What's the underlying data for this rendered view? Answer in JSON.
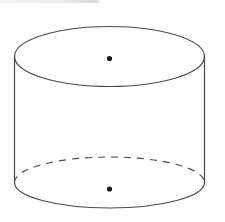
{
  "page": {
    "title": "Cylinder diagram",
    "width": 225,
    "height": 222,
    "background_color": "#ffffff",
    "alt_text": "Line drawing of a right circular cylinder shown in oblique view, with the hidden back half of the base circle drawn as a dashed arc and a dot marking the center of the top face and the center of the base."
  },
  "figure": {
    "name": "cylinder",
    "shape_type": "right-circular-cylinder",
    "stroke_color": "#4a4a50",
    "fill_color": "none",
    "stroke_width": 1.1,
    "top_face": {
      "label": "top circular face",
      "center_x": 109.5,
      "center_y": 56.5,
      "radius_x": 95,
      "radius_y": 30,
      "stroke_style": "solid"
    },
    "bottom_face": {
      "label": "bottom circular face",
      "center_x": 109.5,
      "center_y": 182.5,
      "radius_x": 95,
      "radius_y": 25.5,
      "front_stroke_style": "solid",
      "back_stroke_style": "dashed",
      "dash_pattern": "7 6"
    },
    "left_side_edge": {
      "label": "left lateral edge",
      "x": 14.5,
      "y_top": 56.5,
      "y_bottom": 182.5
    },
    "right_side_edge": {
      "label": "right lateral edge",
      "x": 204.5,
      "y_top": 56.5,
      "y_bottom": 182.5
    },
    "center_points": [
      {
        "label": "top face center point",
        "x": 109.5,
        "y": 58.5,
        "radius": 2.6,
        "color": "#1b1b1b"
      },
      {
        "label": "bottom face center point",
        "x": 109.5,
        "y": 189.0,
        "radius": 2.6,
        "color": "#1b1b1b"
      }
    ]
  },
  "artifacts": {
    "top_strip": {
      "label": "scan edge artifact strip",
      "color": "#ececee"
    }
  }
}
